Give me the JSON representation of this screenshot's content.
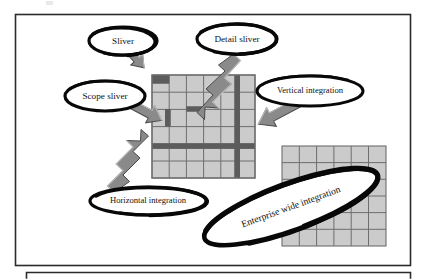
{
  "figure": {
    "title_visible": false,
    "background_color": "#ffffff",
    "frame_color": "#2b2b2b",
    "grid_fill": "#cbcbcb",
    "grid_line": "#6e6e6e",
    "band_color": "#5c5c5c",
    "arrow_fill": "#8a8a8a",
    "arrow_edge": "#4a4a4a",
    "ellipse_stroke": "#080808",
    "text_color": "#111111"
  },
  "labels": {
    "sliver": "Sliver",
    "detail_sliver": "Detail sliver",
    "scope_sliver": "Scope sliver",
    "vertical_integration": "Vertical integration",
    "horizontal_integration": "Horizontal integration",
    "enterprise_wide_integration": "Enterprise wide integration"
  },
  "callouts": [
    {
      "id": "sliver",
      "label": "Sliver",
      "cx": 123,
      "cy": 41,
      "rx": 34,
      "ry": 14,
      "rotate": 0,
      "double_ring": true
    },
    {
      "id": "detail-sliver",
      "label": "Detail sliver",
      "cx": 237,
      "cy": 39,
      "rx": 40,
      "ry": 15,
      "rotate": 0,
      "double_ring": true
    },
    {
      "id": "scope-sliver",
      "label": "Scope sliver",
      "cx": 105,
      "cy": 96,
      "rx": 40,
      "ry": 15,
      "rotate": 0,
      "double_ring": false
    },
    {
      "id": "vertical-integration",
      "label": "Vertical integration",
      "cx": 310,
      "cy": 91,
      "rx": 53,
      "ry": 15,
      "rotate": 0,
      "double_ring": false
    },
    {
      "id": "horizontal-integration",
      "label": "Horizontal integration",
      "cx": 148,
      "cy": 201,
      "rx": 58,
      "ry": 14,
      "rotate": 0,
      "double_ring": true
    },
    {
      "id": "enterprise-wide-integration",
      "label": "Enterprise wide integration",
      "cx": 291,
      "cy": 207,
      "rx": 92,
      "ry": 23,
      "rotate": -20,
      "double_ring": true
    }
  ],
  "main_grid": {
    "x": 152,
    "y": 75,
    "width": 103,
    "height": 103,
    "cols": 6,
    "rows": 6,
    "dark_cells": [
      {
        "col": 0,
        "row": 0
      }
    ],
    "vertical_band_col": 5,
    "horizontal_band_row": 4,
    "short_bands": [
      {
        "col": 0,
        "row": 2,
        "orient": "vertical"
      },
      {
        "col": 2,
        "row": 2,
        "orient": "horizontal"
      }
    ]
  },
  "second_grid": {
    "x": 282,
    "y": 146,
    "width": 104,
    "height": 100,
    "cols": 6,
    "rows": 6
  },
  "arrows": [
    {
      "id": "sliver-arrow",
      "style": "block",
      "from": [
        128,
        52
      ],
      "to": [
        155,
        75
      ]
    },
    {
      "id": "detail-sliver-arrow",
      "style": "zigzag",
      "from": [
        232,
        55
      ],
      "to": [
        188,
        113
      ]
    },
    {
      "id": "scope-sliver-arrow",
      "style": "block",
      "from": [
        128,
        104
      ],
      "to": [
        168,
        122
      ]
    },
    {
      "id": "vertical-integration-arrow",
      "style": "block",
      "from": [
        295,
        105
      ],
      "to": [
        248,
        134
      ]
    },
    {
      "id": "horizontal-integration-arrow",
      "style": "zigzag",
      "from": [
        114,
        194
      ],
      "to": [
        198,
        152
      ]
    }
  ],
  "panels": {
    "outer_top": {
      "x": 15,
      "y": 14,
      "width": 396,
      "height": 252
    },
    "outer_bottom": {
      "x": 26,
      "y": 272,
      "width": 385,
      "height": 7
    }
  }
}
